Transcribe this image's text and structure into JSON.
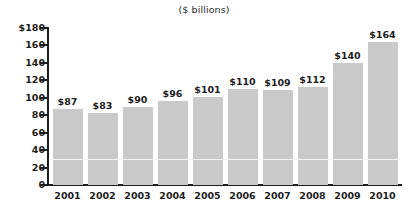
{
  "chart_data": {
    "type": "bar",
    "title": "($ billions)",
    "xlabel": "",
    "ylabel": "",
    "categories": [
      "2001",
      "2002",
      "2003",
      "2004",
      "2005",
      "2006",
      "2007",
      "2008",
      "2009",
      "2010"
    ],
    "values": [
      87,
      83,
      90,
      96,
      101,
      110,
      109,
      112,
      140,
      164
    ],
    "value_labels": [
      "$87",
      "$83",
      "$90",
      "$96",
      "$101",
      "$110",
      "$109",
      "$112",
      "$140",
      "$164"
    ],
    "ylim": [
      0,
      180
    ],
    "ytick_values": [
      180,
      160,
      140,
      120,
      100,
      80,
      60,
      40,
      20,
      0
    ],
    "ytick_labels": [
      "$180",
      "160",
      "140",
      "120",
      "100",
      "80",
      "60",
      "40",
      "20",
      "0"
    ],
    "grid": true,
    "gridline_value": 30,
    "legend": null,
    "legend_position": "none",
    "series": [
      {
        "name": "",
        "values": [
          87,
          83,
          90,
          96,
          101,
          110,
          109,
          112,
          140,
          164
        ]
      }
    ],
    "colors": {
      "bar_fill": "#c9c9c9",
      "axis": "#1d1d1d",
      "text": "#1d1d1d",
      "gridline": "#f2f2f2",
      "background": "#ffffff"
    }
  }
}
